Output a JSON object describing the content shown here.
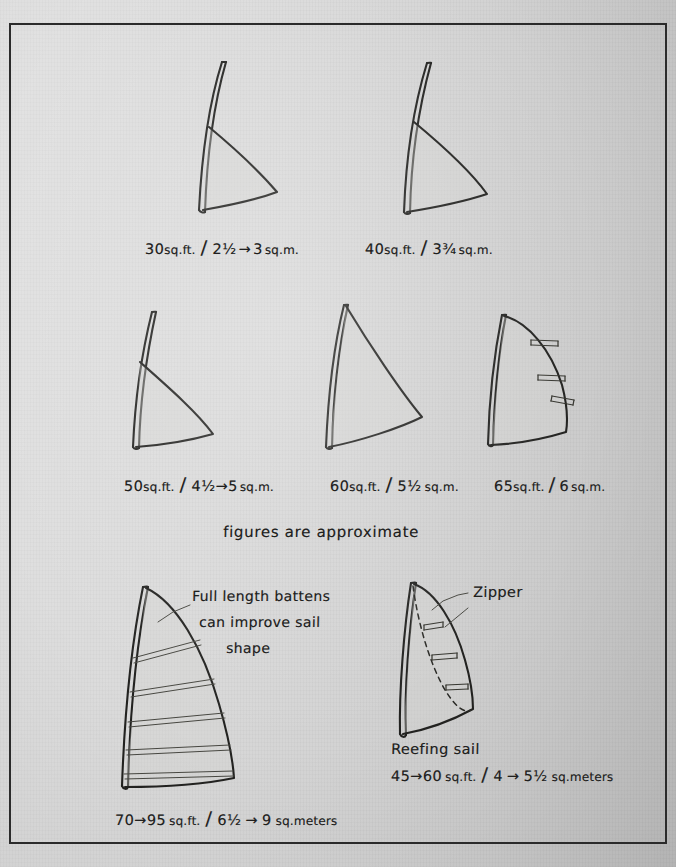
{
  "document": {
    "type": "hand-drawn technical illustration",
    "subject": "Windsurfing sail sizes chart",
    "background_color": "#d7d7d7",
    "ink_color": "#20201f",
    "frame": {
      "border_color": "#2b2b2b",
      "border_width_px": 2.5
    }
  },
  "note": {
    "approximate": "figures are approximate"
  },
  "row1": [
    {
      "id": "sail-30",
      "label": "30 sq.ft. / 2½ → 3 sq.m.",
      "sqft": "30",
      "sqm": "2½ → 3",
      "battens": 0,
      "parts": {
        "sqft_num": "30",
        "sqft_unit": "sq.ft.",
        "slash": "/",
        "sqm_a": "2",
        "frac_a": "½",
        "arrow": "→",
        "sqm_b": "3",
        "sqm_unit": "sq.m."
      }
    },
    {
      "id": "sail-40",
      "label": "40 sq.ft. / 3¾ sq.m.",
      "sqft": "40",
      "sqm": "3¾",
      "battens": 0,
      "parts": {
        "sqft_num": "40",
        "sqft_unit": "sq.ft.",
        "slash": "/",
        "sqm_a": "3",
        "frac_a": "¾",
        "sqm_unit": "sq.m."
      }
    }
  ],
  "row2": [
    {
      "id": "sail-50",
      "label": "50 sq.ft. / 4½ → 5 sq.m.",
      "sqft": "50",
      "sqm": "4½ → 5",
      "battens": 0,
      "parts": {
        "sqft_num": "50",
        "sqft_unit": "sq.ft.",
        "slash": "/",
        "sqm_a": "4",
        "frac_a": "½",
        "arrow": "→",
        "sqm_b": "5",
        "sqm_unit": "sq.m."
      }
    },
    {
      "id": "sail-60",
      "label": "60 sq.ft. / 5½ sq.m.",
      "sqft": "60",
      "sqm": "5½",
      "battens": 0,
      "parts": {
        "sqft_num": "60",
        "sqft_unit": "sq.ft.",
        "slash": "/",
        "sqm_a": "5",
        "frac_a": "½",
        "sqm_unit": "sq.m."
      }
    },
    {
      "id": "sail-65",
      "label": "65 sq.ft. / 6 sq.m.",
      "sqft": "65",
      "sqm": "6",
      "battens": 3,
      "parts": {
        "sqft_num": "65",
        "sqft_unit": "sq.ft.",
        "slash": "/",
        "sqm_a": "6",
        "frac_a": "",
        "sqm_unit": "sq.m."
      }
    }
  ],
  "row3": {
    "batten_sail": {
      "id": "sail-batten",
      "battens": 5,
      "annotation_lines": [
        "Full length battens",
        "can improve sail",
        "shape"
      ],
      "label": "70 → 95 sq.ft. / 6½ → 9 sq.meters",
      "parts": {
        "sqft_a": "70",
        "arrow1": "→",
        "sqft_b": "95",
        "sqft_unit": "sq.ft.",
        "slash": "/",
        "sqm_a": "6",
        "frac_a": "½",
        "arrow2": "→",
        "sqm_b": "9",
        "sqm_unit": "sq.meters"
      }
    },
    "reefing_sail": {
      "id": "sail-reefing",
      "battens": 3,
      "zipper_label": "Zipper",
      "title": "Reefing sail",
      "label": "45 → 60 sq.ft. / 4 → 5½ sq.meters",
      "parts": {
        "sqft_a": "45",
        "arrow1": "→",
        "sqft_b": "60",
        "sqft_unit": "sq.ft.",
        "slash": "/",
        "sqm_a": "4",
        "arrow2": "→",
        "sqm_b": "5",
        "frac_b": "½",
        "sqm_unit": "sq.meters"
      }
    }
  }
}
